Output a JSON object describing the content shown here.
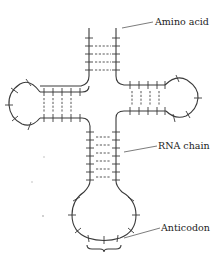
{
  "diagram": {
    "labels": {
      "amino_acid": "Amino acid",
      "rna_chain": "RNA chain",
      "anticodon": "Anticodon"
    },
    "parts": [
      {
        "name": "acceptor-stem",
        "base_pairs": 4
      },
      {
        "name": "left-arm",
        "base_pairs": 4
      },
      {
        "name": "right-arm",
        "base_pairs": 4
      },
      {
        "name": "anticodon-stem",
        "base_pairs": 6
      },
      {
        "name": "anticodon-loop"
      }
    ],
    "colors": {
      "line": "#3a3a3a",
      "background": "#ffffff"
    }
  }
}
